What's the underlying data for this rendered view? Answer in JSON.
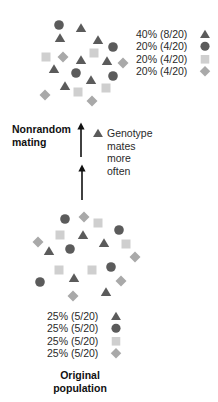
{
  "colors": {
    "triangle": "#5b5b5b",
    "circle": "#5b5b5b",
    "square": "#cfcfcf",
    "diamond": "#a9a9a9",
    "arrow": "#111111"
  },
  "after_population": {
    "legend": [
      {
        "shape": "triangle",
        "text": "40% (8/20)"
      },
      {
        "shape": "circle",
        "text": "20% (4/20)"
      },
      {
        "shape": "square",
        "text": "20% (4/20)"
      },
      {
        "shape": "diamond",
        "text": "20% (4/20)"
      }
    ],
    "individuals": [
      {
        "shape": "circle",
        "x": 59,
        "y": 25
      },
      {
        "shape": "triangle",
        "x": 81,
        "y": 28
      },
      {
        "shape": "triangle",
        "x": 60,
        "y": 38
      },
      {
        "shape": "triangle",
        "x": 98,
        "y": 40
      },
      {
        "shape": "circle",
        "x": 113,
        "y": 47
      },
      {
        "shape": "square",
        "x": 46,
        "y": 57
      },
      {
        "shape": "diamond",
        "x": 63,
        "y": 57
      },
      {
        "shape": "square",
        "x": 94,
        "y": 53
      },
      {
        "shape": "triangle",
        "x": 81,
        "y": 60
      },
      {
        "shape": "triangle",
        "x": 107,
        "y": 61
      },
      {
        "shape": "diamond",
        "x": 123,
        "y": 63
      },
      {
        "shape": "triangle",
        "x": 54,
        "y": 69
      },
      {
        "shape": "circle",
        "x": 76,
        "y": 73
      },
      {
        "shape": "triangle",
        "x": 91,
        "y": 80
      },
      {
        "shape": "circle",
        "x": 113,
        "y": 76
      },
      {
        "shape": "triangle",
        "x": 65,
        "y": 86
      },
      {
        "shape": "square",
        "x": 78,
        "y": 92
      },
      {
        "shape": "square",
        "x": 106,
        "y": 88
      },
      {
        "shape": "diamond",
        "x": 45,
        "y": 95
      },
      {
        "shape": "diamond",
        "x": 92,
        "y": 101
      }
    ]
  },
  "process": {
    "label_line1": "Nonrandom",
    "label_line2": "mating",
    "note_shape": "triangle",
    "note_lines": [
      "Genotype",
      "mates",
      "more",
      "often"
    ]
  },
  "original_population": {
    "legend": [
      {
        "shape": "triangle",
        "text": "25% (5/20)"
      },
      {
        "shape": "circle",
        "text": "25% (5/20)"
      },
      {
        "shape": "square",
        "text": "25% (5/20)"
      },
      {
        "shape": "diamond",
        "text": "25% (5/20)"
      }
    ],
    "label_line1": "Original",
    "label_line2": "population",
    "individuals": [
      {
        "shape": "circle",
        "x": 65,
        "y": 219
      },
      {
        "shape": "diamond",
        "x": 84,
        "y": 217
      },
      {
        "shape": "square",
        "x": 98,
        "y": 223
      },
      {
        "shape": "circle",
        "x": 119,
        "y": 230
      },
      {
        "shape": "square",
        "x": 60,
        "y": 235
      },
      {
        "shape": "triangle",
        "x": 83,
        "y": 235
      },
      {
        "shape": "diamond",
        "x": 38,
        "y": 242
      },
      {
        "shape": "square",
        "x": 126,
        "y": 244
      },
      {
        "shape": "triangle",
        "x": 104,
        "y": 243
      },
      {
        "shape": "triangle",
        "x": 49,
        "y": 251
      },
      {
        "shape": "circle",
        "x": 70,
        "y": 249
      },
      {
        "shape": "diamond",
        "x": 135,
        "y": 257
      },
      {
        "shape": "square",
        "x": 59,
        "y": 270
      },
      {
        "shape": "square",
        "x": 92,
        "y": 270
      },
      {
        "shape": "circle",
        "x": 111,
        "y": 267
      },
      {
        "shape": "triangle",
        "x": 74,
        "y": 278
      },
      {
        "shape": "circle",
        "x": 40,
        "y": 282
      },
      {
        "shape": "diamond",
        "x": 121,
        "y": 281
      },
      {
        "shape": "diamond",
        "x": 73,
        "y": 296
      },
      {
        "shape": "triangle",
        "x": 106,
        "y": 292
      }
    ]
  }
}
